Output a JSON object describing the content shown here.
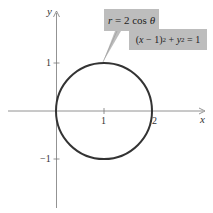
{
  "diagram": {
    "axes": {
      "x_label": "x",
      "y_label": "y",
      "x_ticks": [
        "1",
        "2"
      ],
      "y_ticks": [
        "1",
        "−1"
      ]
    },
    "curve": {
      "type": "circle",
      "center": [
        1,
        0
      ],
      "radius": 1,
      "stroke_color": "#333333"
    },
    "labels": {
      "polar": {
        "r": "r",
        "rest": " = 2 cos ",
        "theta": "θ"
      },
      "cartesian": {
        "lhs_open": "(",
        "x": "x",
        "minus": " − 1)",
        "sq1": "2",
        "plus": " + ",
        "y": "y",
        "sq2": "2",
        "eq": " = 1"
      }
    },
    "label_bg_color": "#bdbdbd"
  }
}
